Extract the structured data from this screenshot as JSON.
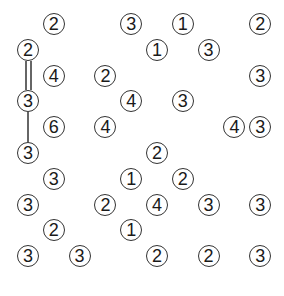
{
  "puzzle": {
    "type": "hashiwokakero",
    "rows": 10,
    "cols": 10,
    "islands": [
      {
        "r": 0,
        "c": 1,
        "n": "2"
      },
      {
        "r": 0,
        "c": 4,
        "n": "3"
      },
      {
        "r": 0,
        "c": 6,
        "n": "1"
      },
      {
        "r": 0,
        "c": 9,
        "n": "2"
      },
      {
        "r": 1,
        "c": 0,
        "n": "2"
      },
      {
        "r": 1,
        "c": 5,
        "n": "1"
      },
      {
        "r": 1,
        "c": 7,
        "n": "3"
      },
      {
        "r": 2,
        "c": 1,
        "n": "4"
      },
      {
        "r": 2,
        "c": 3,
        "n": "2"
      },
      {
        "r": 2,
        "c": 9,
        "n": "3"
      },
      {
        "r": 3,
        "c": 0,
        "n": "3"
      },
      {
        "r": 3,
        "c": 4,
        "n": "4"
      },
      {
        "r": 3,
        "c": 6,
        "n": "3"
      },
      {
        "r": 4,
        "c": 1,
        "n": "6"
      },
      {
        "r": 4,
        "c": 3,
        "n": "4"
      },
      {
        "r": 4,
        "c": 8,
        "n": "4"
      },
      {
        "r": 4,
        "c": 9,
        "n": "3"
      },
      {
        "r": 5,
        "c": 0,
        "n": "3"
      },
      {
        "r": 5,
        "c": 5,
        "n": "2"
      },
      {
        "r": 6,
        "c": 1,
        "n": "3"
      },
      {
        "r": 6,
        "c": 4,
        "n": "1"
      },
      {
        "r": 6,
        "c": 6,
        "n": "2"
      },
      {
        "r": 7,
        "c": 0,
        "n": "3"
      },
      {
        "r": 7,
        "c": 3,
        "n": "2"
      },
      {
        "r": 7,
        "c": 5,
        "n": "4"
      },
      {
        "r": 7,
        "c": 7,
        "n": "3"
      },
      {
        "r": 7,
        "c": 9,
        "n": "3"
      },
      {
        "r": 8,
        "c": 1,
        "n": "2"
      },
      {
        "r": 8,
        "c": 4,
        "n": "1"
      },
      {
        "r": 9,
        "c": 0,
        "n": "3"
      },
      {
        "r": 9,
        "c": 2,
        "n": "3"
      },
      {
        "r": 9,
        "c": 5,
        "n": "2"
      },
      {
        "r": 9,
        "c": 7,
        "n": "2"
      },
      {
        "r": 9,
        "c": 9,
        "n": "3"
      }
    ],
    "bridges": [
      {
        "from": {
          "r": 1,
          "c": 0
        },
        "to": {
          "r": 3,
          "c": 0
        },
        "count": 2
      },
      {
        "from": {
          "r": 3,
          "c": 0
        },
        "to": {
          "r": 5,
          "c": 0
        },
        "count": 1
      }
    ]
  }
}
